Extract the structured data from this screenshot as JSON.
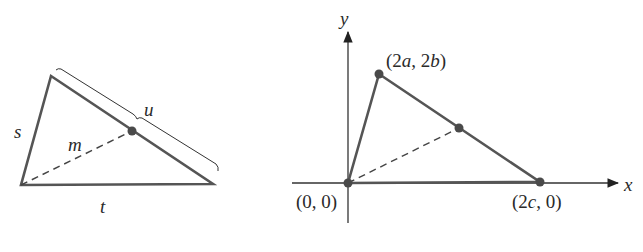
{
  "figure": {
    "left_panel": {
      "description": "Triangle with sides s, t, u and median m to side u",
      "labels": {
        "side_left": "s",
        "median": "m",
        "side_upper": "u",
        "side_bottom": "t"
      }
    },
    "right_panel": {
      "description": "Triangle placed on coordinate axes with median from origin to midpoint of opposite side",
      "axes": {
        "x_label": "x",
        "y_label": "y"
      },
      "points": {
        "origin": {
          "label": "(0, 0)",
          "num_open": "(0, 0)"
        },
        "top": {
          "label": "(2a, 2b)",
          "p1": "(2",
          "v1": "a",
          "sep": ", 2",
          "v2": "b",
          "p2": ")"
        },
        "right": {
          "label": "(2c, 0)",
          "p1": "(2",
          "v1": "c",
          "p2": ", 0)"
        }
      }
    },
    "colors": {
      "triangle_stroke": "#555555",
      "axis_stroke": "#333333",
      "point_fill": "#4a4a4a",
      "text": "#2a2a2a"
    }
  }
}
